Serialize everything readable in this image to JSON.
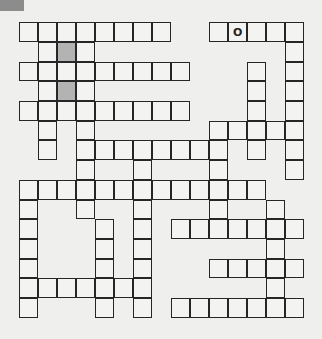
{
  "puzzle": {
    "type": "crossword",
    "rows": 15,
    "cols": 15,
    "header_tab_color": "#8c8c8c",
    "shaded_color": "#b3b3b3",
    "cells": [
      [
        0,
        0
      ],
      [
        0,
        1
      ],
      [
        0,
        2
      ],
      [
        0,
        3
      ],
      [
        0,
        4
      ],
      [
        0,
        5
      ],
      [
        0,
        6
      ],
      [
        0,
        7
      ],
      [
        0,
        10
      ],
      [
        0,
        11,
        "O"
      ],
      [
        0,
        12
      ],
      [
        0,
        13
      ],
      [
        0,
        14
      ],
      [
        1,
        1
      ],
      [
        1,
        2,
        "",
        true
      ],
      [
        1,
        3
      ],
      [
        1,
        14
      ],
      [
        2,
        0
      ],
      [
        2,
        1
      ],
      [
        2,
        2
      ],
      [
        2,
        3
      ],
      [
        2,
        4
      ],
      [
        2,
        5
      ],
      [
        2,
        6
      ],
      [
        2,
        7
      ],
      [
        2,
        8
      ],
      [
        2,
        12
      ],
      [
        2,
        14
      ],
      [
        3,
        1
      ],
      [
        3,
        2,
        "",
        true
      ],
      [
        3,
        3
      ],
      [
        3,
        12
      ],
      [
        3,
        14
      ],
      [
        4,
        0
      ],
      [
        4,
        1
      ],
      [
        4,
        2
      ],
      [
        4,
        3
      ],
      [
        4,
        4
      ],
      [
        4,
        5
      ],
      [
        4,
        6
      ],
      [
        4,
        7
      ],
      [
        4,
        8
      ],
      [
        4,
        12
      ],
      [
        4,
        14
      ],
      [
        5,
        1
      ],
      [
        5,
        3
      ],
      [
        5,
        10
      ],
      [
        5,
        11
      ],
      [
        5,
        12
      ],
      [
        5,
        13
      ],
      [
        5,
        14
      ],
      [
        6,
        1
      ],
      [
        6,
        3
      ],
      [
        6,
        4
      ],
      [
        6,
        5
      ],
      [
        6,
        6
      ],
      [
        6,
        7
      ],
      [
        6,
        8
      ],
      [
        6,
        9
      ],
      [
        6,
        10
      ],
      [
        6,
        12
      ],
      [
        6,
        14
      ],
      [
        7,
        3
      ],
      [
        7,
        6
      ],
      [
        7,
        10
      ],
      [
        7,
        14
      ],
      [
        8,
        0
      ],
      [
        8,
        1
      ],
      [
        8,
        2
      ],
      [
        8,
        3
      ],
      [
        8,
        4
      ],
      [
        8,
        5
      ],
      [
        8,
        6
      ],
      [
        8,
        7
      ],
      [
        8,
        8
      ],
      [
        8,
        9
      ],
      [
        8,
        10
      ],
      [
        8,
        11
      ],
      [
        8,
        12
      ],
      [
        9,
        0
      ],
      [
        9,
        3
      ],
      [
        9,
        6
      ],
      [
        9,
        10
      ],
      [
        9,
        13
      ],
      [
        10,
        0
      ],
      [
        10,
        4
      ],
      [
        10,
        6
      ],
      [
        10,
        8
      ],
      [
        10,
        9
      ],
      [
        10,
        10
      ],
      [
        10,
        11
      ],
      [
        10,
        12
      ],
      [
        10,
        13
      ],
      [
        10,
        14
      ],
      [
        11,
        0
      ],
      [
        11,
        4
      ],
      [
        11,
        6
      ],
      [
        11,
        13
      ],
      [
        12,
        0
      ],
      [
        12,
        4
      ],
      [
        12,
        6
      ],
      [
        12,
        10
      ],
      [
        12,
        11
      ],
      [
        12,
        12
      ],
      [
        12,
        13
      ],
      [
        12,
        14
      ],
      [
        13,
        0
      ],
      [
        13,
        1
      ],
      [
        13,
        2
      ],
      [
        13,
        3
      ],
      [
        13,
        4
      ],
      [
        13,
        5
      ],
      [
        13,
        6
      ],
      [
        13,
        13
      ],
      [
        14,
        0
      ],
      [
        14,
        4
      ],
      [
        14,
        6
      ],
      [
        14,
        8
      ],
      [
        14,
        9
      ],
      [
        14,
        10
      ],
      [
        14,
        11
      ],
      [
        14,
        12
      ],
      [
        14,
        13
      ],
      [
        14,
        14
      ]
    ]
  }
}
